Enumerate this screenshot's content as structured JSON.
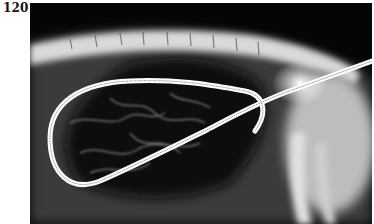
{
  "figure": {
    "label": "120",
    "image": {
      "kind": "radiograph",
      "description": "Lateral X-ray showing a looped coiled catheter/wire in the abdomen, spine along the top"
    }
  }
}
